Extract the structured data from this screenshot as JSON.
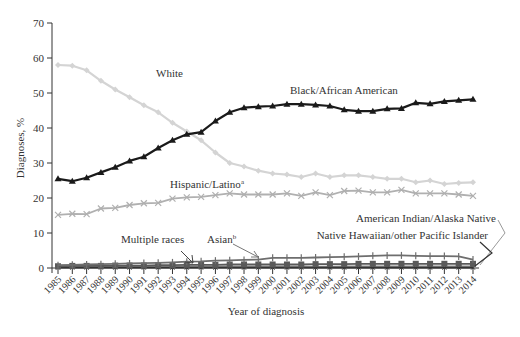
{
  "chart_data": {
    "type": "line",
    "title": "",
    "xlabel": "Year of diagnosis",
    "ylabel": "Diagnoses, %",
    "ylim": [
      0,
      70
    ],
    "yticks": [
      0,
      10,
      20,
      30,
      40,
      50,
      60,
      70
    ],
    "grid": false,
    "legend_position": "inline labels",
    "x": [
      1985,
      1986,
      1987,
      1988,
      1989,
      1990,
      1991,
      1992,
      1993,
      1994,
      1995,
      1996,
      1997,
      1998,
      1999,
      2000,
      2001,
      2002,
      2003,
      2004,
      2005,
      2006,
      2007,
      2008,
      2009,
      2010,
      2011,
      2012,
      2013,
      2014
    ],
    "series": [
      {
        "name": "White",
        "color": "#d4d4d4",
        "marker": "diamond",
        "values": [
          58.0,
          57.8,
          56.5,
          53.5,
          51.0,
          48.8,
          46.5,
          44.5,
          41.5,
          39.0,
          36.5,
          33.0,
          30.0,
          29.0,
          27.8,
          27.0,
          26.7,
          26.0,
          27.0,
          26.0,
          26.5,
          26.5,
          26.0,
          25.5,
          25.5,
          24.5,
          25.0,
          24.0,
          24.3,
          24.5
        ]
      },
      {
        "name": "Black/African American",
        "color": "#1a1a1a",
        "marker": "triangle",
        "values": [
          25.5,
          24.8,
          25.8,
          27.3,
          28.8,
          30.6,
          31.8,
          34.3,
          36.5,
          38.2,
          38.8,
          42.0,
          44.5,
          45.8,
          46.1,
          46.3,
          46.8,
          46.8,
          46.6,
          46.3,
          45.2,
          44.8,
          44.8,
          45.5,
          45.6,
          47.2,
          46.9,
          47.6,
          47.9,
          48.2
        ]
      },
      {
        "name": "Hispanic/Latino",
        "superscript": "a",
        "color": "#b0b0b0",
        "marker": "x",
        "values": [
          15.2,
          15.5,
          15.4,
          17.0,
          17.2,
          18.0,
          18.5,
          18.6,
          19.8,
          20.2,
          20.3,
          20.8,
          21.3,
          21.0,
          21.0,
          21.0,
          21.3,
          20.6,
          21.6,
          20.8,
          22.0,
          22.1,
          21.6,
          21.6,
          22.3,
          21.3,
          21.3,
          21.3,
          21.0,
          20.6
        ]
      },
      {
        "name": "Asian",
        "superscript": "b",
        "color": "#6e6e6e",
        "marker": "plus",
        "values": [
          0.8,
          0.9,
          1.0,
          1.1,
          1.2,
          1.3,
          1.4,
          1.5,
          1.6,
          1.8,
          1.9,
          2.1,
          2.2,
          2.3,
          2.4,
          2.9,
          2.9,
          2.9,
          3.0,
          3.1,
          3.2,
          3.3,
          3.5,
          3.6,
          3.6,
          3.5,
          3.4,
          3.4,
          3.3,
          2.4
        ]
      },
      {
        "name": "Multiple races",
        "color": "#5a5a5a",
        "marker": "square",
        "values": [
          0.5,
          0.6,
          0.6,
          0.6,
          0.7,
          0.7,
          0.7,
          0.8,
          0.8,
          0.9,
          0.9,
          0.9,
          1.0,
          1.0,
          1.0,
          1.0,
          1.0,
          1.0,
          1.1,
          1.1,
          1.1,
          1.2,
          1.2,
          1.2,
          1.2,
          1.2,
          1.2,
          1.2,
          1.2,
          1.2
        ]
      },
      {
        "name": "American Indian/Alaska Native",
        "color": "#8a8a8a",
        "marker": "circle",
        "values": [
          0.4,
          0.4,
          0.4,
          0.4,
          0.4,
          0.4,
          0.4,
          0.4,
          0.4,
          0.4,
          0.4,
          0.4,
          0.4,
          0.4,
          0.4,
          0.4,
          0.4,
          0.4,
          0.4,
          0.4,
          0.5,
          0.5,
          0.5,
          0.5,
          0.5,
          0.5,
          0.5,
          0.5,
          0.5,
          0.5
        ]
      },
      {
        "name": "Native Hawaiian/other Pacific Islander",
        "color": "#333333",
        "marker": "x-small",
        "values": [
          0.1,
          0.1,
          0.1,
          0.1,
          0.1,
          0.1,
          0.1,
          0.1,
          0.1,
          0.1,
          0.1,
          0.1,
          0.1,
          0.1,
          0.1,
          0.1,
          0.1,
          0.1,
          0.1,
          0.1,
          0.1,
          0.1,
          0.1,
          0.1,
          0.1,
          0.1,
          0.1,
          0.1,
          0.1,
          0.1
        ]
      }
    ],
    "annotations": [
      {
        "text": "White",
        "x": 1990,
        "y": 54
      },
      {
        "text": "Black/African American",
        "x": 2001,
        "y": 50
      },
      {
        "text": "Hispanic/Latino",
        "sup": "a",
        "x": 1993,
        "y": 23.5
      },
      {
        "text": "Multiple races",
        "x": 1991,
        "y": 4.5
      },
      {
        "text": "Asian",
        "sup": "b",
        "x": 1997,
        "y": 4.5
      },
      {
        "text": "American Indian/Alaska Native",
        "x": 2009,
        "y": 7.5
      },
      {
        "text": "Native Hawaiian/other Pacific Islander",
        "x": 2008,
        "y": 5.5
      }
    ]
  },
  "labels": {
    "ylabel": "Diagnoses, %",
    "xlabel": "Year of diagnosis",
    "white": "White",
    "black": "Black/African American",
    "hispanic": "Hispanic/Latino",
    "hispanic_sup": "a",
    "multiple": "Multiple races",
    "asian": "Asian",
    "asian_sup": "b",
    "aian": "American Indian/Alaska Native",
    "nhpi": "Native Hawaiian/other Pacific Islander"
  }
}
